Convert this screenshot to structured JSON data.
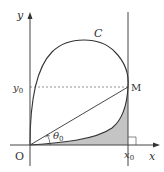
{
  "diagram": {
    "axes": {
      "x_label": "x",
      "y_label": "y",
      "origin_label": "O"
    },
    "curve_label": "C",
    "point_label": "M",
    "y0_label": "y",
    "y0_sub": "0",
    "x0_label": "x",
    "x0_sub": "0",
    "angle_label": "θ",
    "angle_sub": "0",
    "colors": {
      "stroke": "#333333",
      "shade": "#bdbdbd",
      "axis": "#555555"
    }
  }
}
